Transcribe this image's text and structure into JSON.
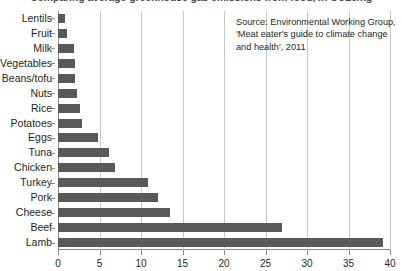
{
  "chart_data": {
    "type": "bar",
    "orientation": "horizontal",
    "title": "Comparing average greenhouse gas emissions from food, in CO2e/kg",
    "subtitle": "",
    "xlabel": "",
    "ylabel": "",
    "xlim": [
      0,
      40
    ],
    "ylim": null,
    "grid": true,
    "legend": null,
    "bar_color": "#595959",
    "categories": [
      "Lentils",
      "Fruit",
      "Milk",
      "Vegetables",
      "Beans/tofu",
      "Nuts",
      "Rice",
      "Potatoes",
      "Eggs",
      "Tuna",
      "Chicken",
      "Turkey",
      "Pork",
      "Cheese",
      "Beef",
      "Lamb"
    ],
    "values": [
      0.9,
      1.1,
      1.9,
      2.0,
      2.0,
      2.3,
      2.7,
      2.9,
      4.8,
      6.1,
      6.9,
      10.9,
      12.1,
      13.5,
      27.0,
      39.2
    ],
    "xticks": [
      0,
      5,
      10,
      15,
      20,
      25,
      30,
      35,
      40
    ],
    "xticklabels": [
      "0",
      "5",
      "10",
      "15",
      "20",
      "25",
      "30",
      "35",
      "40"
    ],
    "annotations": [
      {
        "name": "source-note",
        "lines": [
          "Source: Environmental Working Group,",
          "'Meat eater's guide to climate change",
          "and health', 2011"
        ]
      }
    ]
  }
}
